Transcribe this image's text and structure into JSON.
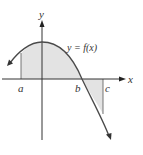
{
  "figure": {
    "axis_labels": {
      "x": "x",
      "y": "y"
    },
    "curve_label": "y = f(x)",
    "point_labels": {
      "a": "a",
      "b": "b",
      "c": "c"
    },
    "colors": {
      "curve": "#4a4a4a",
      "axis": "#333333",
      "shade": "#e3e3e3",
      "text": "#333333",
      "background": "#ffffff"
    }
  }
}
